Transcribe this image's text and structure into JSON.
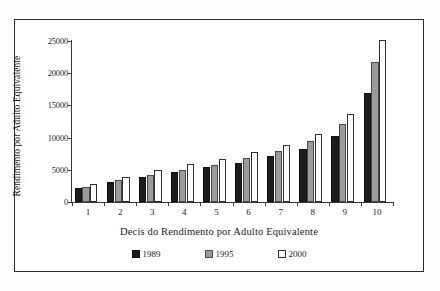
{
  "chart_data": {
    "type": "bar",
    "title": "",
    "xlabel": "Decis do Rendimento por Adulto Equivalente",
    "ylabel": "Rendimento por Adulto Equivalente",
    "categories": [
      "1",
      "2",
      "3",
      "4",
      "5",
      "6",
      "7",
      "8",
      "9",
      "10"
    ],
    "series": [
      {
        "name": "1989",
        "color": "#1c1c1c",
        "values": [
          2200,
          3100,
          3900,
          4600,
          5400,
          6100,
          7100,
          8200,
          10300,
          17000
        ]
      },
      {
        "name": "1995",
        "color": "#9a9a9a",
        "values": [
          2300,
          3400,
          4200,
          5000,
          5800,
          6800,
          7900,
          9400,
          12100,
          21700
        ]
      },
      {
        "name": "2000",
        "color": "#ffffff",
        "values": [
          2800,
          3900,
          4900,
          5900,
          6700,
          7800,
          8900,
          10500,
          13600,
          25100
        ]
      }
    ],
    "ylim": [
      0,
      25000
    ],
    "yticks": [
      0,
      5000,
      10000,
      15000,
      20000,
      25000
    ],
    "ytick_labels": [
      "0",
      "5000",
      "10000",
      "15000",
      "20000",
      "25000"
    ],
    "grid": false,
    "legend_position": "bottom"
  },
  "legend": {
    "items": [
      {
        "label": "1989",
        "swatch": "black-square-icon"
      },
      {
        "label": "1995",
        "swatch": "gray-square-icon"
      },
      {
        "label": "2000",
        "swatch": "white-square-icon"
      }
    ]
  }
}
